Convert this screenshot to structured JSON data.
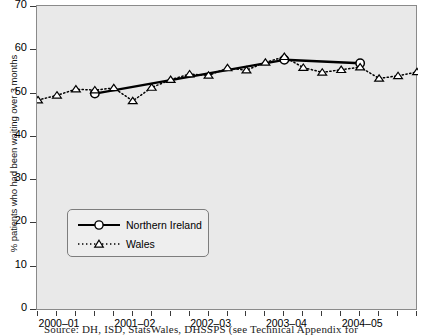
{
  "chart_data": {
    "type": "line",
    "title": "",
    "xlabel": "",
    "ylabel": "% patients who had been waiting over 3 months",
    "ylim": [
      0,
      70
    ],
    "yticks": [
      0,
      10,
      20,
      30,
      40,
      50,
      60,
      70
    ],
    "grid": false,
    "legend_position": "lower-left-inside",
    "xtick_labels": [
      "2000–01",
      "2001–02",
      "2002–03",
      "2003–04",
      "2004–05"
    ],
    "x_minor_ticks": 21,
    "series": [
      {
        "name": "Northern Ireland",
        "color": "#000000",
        "linestyle": "solid",
        "marker": "circle",
        "x": [
          3,
          13,
          17
        ],
        "values": [
          50.0,
          57.8,
          57.0
        ]
      },
      {
        "name": "Wales",
        "color": "#000000",
        "linestyle": "dotted",
        "marker": "triangle",
        "x": [
          0,
          1,
          2,
          3,
          4,
          5,
          6,
          7,
          8,
          9,
          10,
          11,
          12,
          13,
          14,
          15,
          16,
          17,
          18,
          19,
          20
        ],
        "values": [
          48.5,
          49.6,
          51.0,
          50.8,
          51.3,
          48.3,
          51.4,
          53.2,
          54.5,
          54.2,
          55.9,
          55.4,
          57.2,
          58.5,
          56.0,
          54.9,
          55.5,
          56.1,
          53.5,
          54.1,
          55.0
        ]
      }
    ]
  },
  "axis": {
    "y_title": "% patients who had been waiting over 3 months",
    "y_tick_labels": [
      "0",
      "10",
      "20",
      "30",
      "40",
      "50",
      "60",
      "70"
    ],
    "x_tick_labels": [
      "2000–01",
      "2001–02",
      "2002–03",
      "2003–04",
      "2004–05"
    ]
  },
  "legend": {
    "entries": [
      {
        "label": "Northern Ireland",
        "marker": "circle-marker",
        "style": "solid-line"
      },
      {
        "label": "Wales",
        "marker": "triangle-marker",
        "style": "dotted-line"
      }
    ]
  },
  "footer": {
    "source": "Source: DH, ISD, StatsWales, DHSSPS (see Technical Appendix for"
  },
  "colors": {
    "plot_background": "#e9e9e9",
    "page_background": "#ffffff",
    "line": "#000000",
    "axis": "#3a3a3a",
    "frame": "#8a8a8a"
  }
}
